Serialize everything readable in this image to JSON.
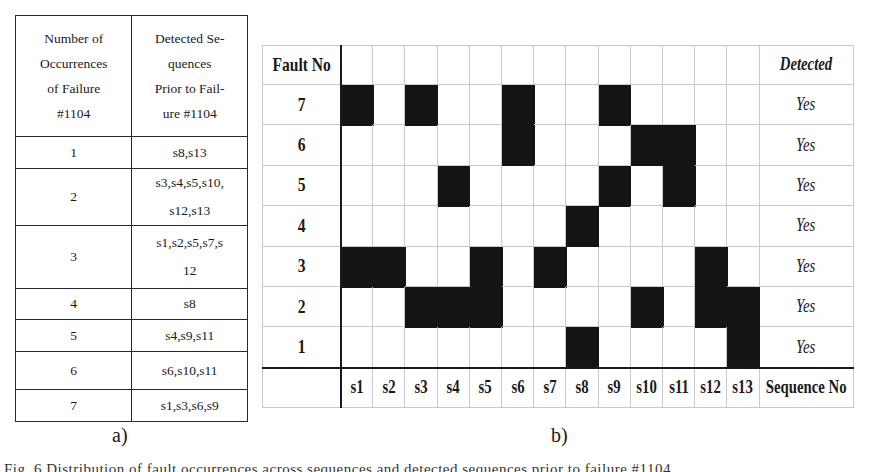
{
  "table_a": {
    "label": "a)",
    "headers": [
      [
        "Number of",
        "Occurrences",
        "of  Failure",
        "#1104"
      ],
      [
        "Detected Se-",
        "quences",
        "Prior to Fail-",
        "ure #1104"
      ]
    ],
    "rows": [
      {
        "count": "1",
        "sequences": [
          "s8,s13"
        ]
      },
      {
        "count": "2",
        "sequences": [
          "s3,s4,s5,s10,",
          "s12,s13"
        ]
      },
      {
        "count": "3",
        "sequences": [
          "s1,s2,s5,s7,s",
          "12"
        ]
      },
      {
        "count": "4",
        "sequences": [
          "s8"
        ]
      },
      {
        "count": "5",
        "sequences": [
          "s4,s9,s11"
        ]
      },
      {
        "count": "6",
        "sequences": [
          "s6,s10,s11"
        ]
      },
      {
        "count": "7",
        "sequences": [
          "s1,s3,s6,s9"
        ]
      }
    ]
  },
  "grid_b": {
    "label": "b)",
    "row_header": "Fault No",
    "col_footer": "Sequence No",
    "detected_header": "Detected",
    "sequences": [
      "s1",
      "s2",
      "s3",
      "s4",
      "s5",
      "s6",
      "s7",
      "s8",
      "s9",
      "s10",
      "s11",
      "s12",
      "s13"
    ],
    "rows": [
      {
        "fault": "7",
        "detected": "Yes",
        "active": [
          "s1",
          "s3",
          "s6",
          "s9"
        ]
      },
      {
        "fault": "6",
        "detected": "Yes",
        "active": [
          "s6",
          "s10",
          "s11"
        ]
      },
      {
        "fault": "5",
        "detected": "Yes",
        "active": [
          "s4",
          "s9",
          "s11"
        ]
      },
      {
        "fault": "4",
        "detected": "Yes",
        "active": [
          "s8"
        ]
      },
      {
        "fault": "3",
        "detected": "Yes",
        "active": [
          "s1",
          "s2",
          "s5",
          "s7",
          "s12"
        ]
      },
      {
        "fault": "2",
        "detected": "Yes",
        "active": [
          "s3",
          "s4",
          "s5",
          "s10",
          "s12",
          "s13"
        ]
      },
      {
        "fault": "1",
        "detected": "Yes",
        "active": [
          "s8",
          "s13"
        ]
      }
    ],
    "colors": {
      "filled": "#141414",
      "grid": "#c9c9c9",
      "axis": "#1a1a1a"
    }
  },
  "caption": {
    "text": "Fig. 6 Distribution of fault occurrences across sequences and detected sequences prior to failure #1104"
  }
}
